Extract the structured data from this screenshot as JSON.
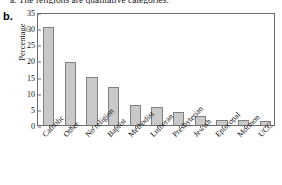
{
  "caption": {
    "top_line": "a. The religions are qualitative categories.",
    "part_label": "b."
  },
  "chart_data": {
    "type": "bar",
    "title": "",
    "xlabel": "",
    "ylabel": "Percentage",
    "ylim": [
      0,
      35
    ],
    "yticks": [
      0,
      5,
      10,
      15,
      20,
      25,
      30,
      35
    ],
    "grid": false,
    "legend": "none",
    "bar_fill_color": "#c9c9c9",
    "bar_edge_color": "#808080",
    "axis_color": "#6d6d6d",
    "categories": [
      "Catholic",
      "Other",
      "No religion",
      "Baptist",
      "Methodist",
      "Lutheran",
      "Presbyterian",
      "Jewish",
      "Episcopal",
      "Mormon",
      "UCC"
    ],
    "values": [
      30.5,
      19.5,
      15.0,
      11.7,
      6.3,
      5.7,
      4.0,
      2.8,
      1.6,
      1.4,
      1.3
    ]
  }
}
